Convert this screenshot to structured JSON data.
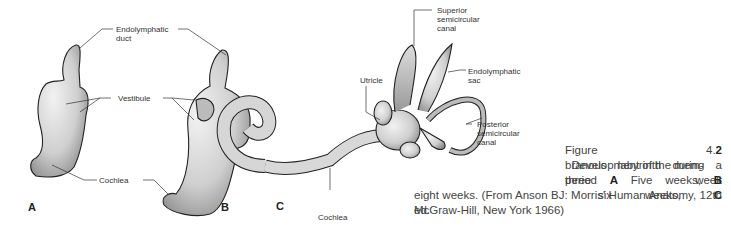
{
  "figure": {
    "number": "4.2",
    "caption": {
      "prefix": "Figure 4.",
      "number_bold": "2",
      "line1_rest": "  Development of the mem-",
      "line2": "branous labyrinth during a three week",
      "line3_parts": [
        "period ",
        "A",
        " Five weeks, ",
        "B",
        " six weeks, ",
        "C"
      ],
      "line4": "eight weeks. (From Anson BJ: Morris' Human Anatomy, 12th ed.",
      "line5": "McGraw-Hill, New York 1966)"
    },
    "panels": [
      {
        "letter": "A",
        "stage": "Five weeks"
      },
      {
        "letter": "B",
        "stage": "six weeks"
      },
      {
        "letter": "C",
        "stage": "eight weeks"
      }
    ],
    "labels": {
      "endolymphatic_duct": "Endolymphatic\nduct",
      "vestibule": "Vestibule",
      "cochlea_ab": "Cochlea",
      "superior_canal": "Superior\nsemicircular\ncanal",
      "utricle": "Utricle",
      "endolymphatic_sac": "Endolymphatic\nsac",
      "posterior_canal": "Posterior\nsemicircular\ncanal",
      "cochlea_c": "Cochlea"
    }
  }
}
